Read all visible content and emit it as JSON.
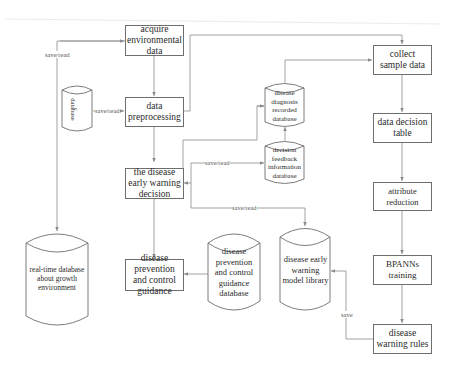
{
  "diagram": {
    "type": "flowchart",
    "colors": {
      "line": "#8a8a8a",
      "border": "#6e6e6e",
      "text": "#2a2a2a",
      "background": "#ffffff"
    },
    "processes": {
      "acquire": "acquire environmental data",
      "preprocess": "data preprocessing",
      "decision": "the disease early warning decision",
      "guidance": "disease prevention and control guidance",
      "collect": "collect sample data",
      "decision_table": "data decision table",
      "attribute_reduction": "attribute reduction",
      "bpanns": "BPANNs training",
      "warning_rules": "disease warning rules"
    },
    "databases": {
      "small_db_line1": "database",
      "small_db_line2": "c",
      "diagnosis": "disease diagnosis recorded database",
      "feedback": "decision feedback information database",
      "realtime": "real-time database about growth environment",
      "guidance_db": "disease prevention and control guidance database",
      "model_library": "disease early warning model library"
    },
    "edge_labels": {
      "save_read_left": "save/read",
      "save_read_small_db": "save/read",
      "save_read_feedback": "save/read",
      "save_read_library": "save/read",
      "save_rules": "save"
    }
  }
}
